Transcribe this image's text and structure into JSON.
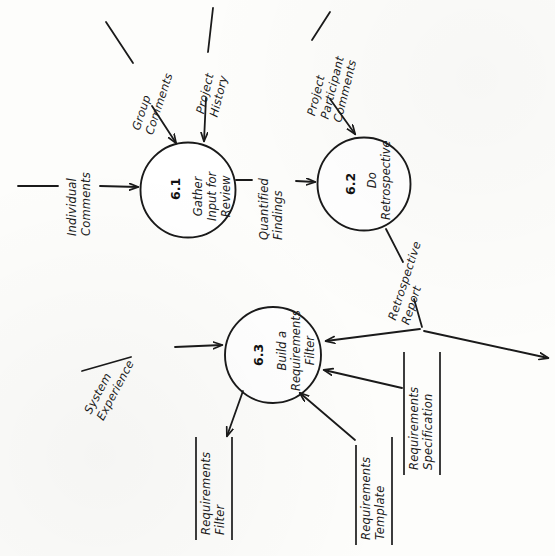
{
  "diagram": {
    "orientation": "rotated-90-ccw",
    "processes": [
      {
        "id": "6.1",
        "name": "Gather\nInput for\nReview"
      },
      {
        "id": "6.2",
        "name": "Do\nRetrospective"
      },
      {
        "id": "6.3",
        "name": "Build a\nRequirements\nFilter"
      }
    ],
    "flows": [
      {
        "label": "Individual\nComments",
        "from": "external",
        "to": "6.1"
      },
      {
        "label": "Group\nComments",
        "from": "external",
        "to": "6.1"
      },
      {
        "label": "Project\nHistory",
        "from": "external",
        "to": "6.1"
      },
      {
        "label": "Quantified\nFindings",
        "from": "6.1",
        "to": "6.2"
      },
      {
        "label": "Project\nParticipant\nComments",
        "from": "external",
        "to": "6.2"
      },
      {
        "label": "Retrospective\nReport",
        "from": "6.2",
        "to": "6.3"
      },
      {
        "label": "System\nExperience",
        "from": "external",
        "to": "6.3"
      }
    ],
    "data_stores": [
      {
        "label": "Requirements\nFilter",
        "direction": "out"
      },
      {
        "label": "Requirements\nTemplate",
        "direction": "in"
      },
      {
        "label": "Requirements\nSpecification",
        "direction": "in"
      }
    ]
  }
}
